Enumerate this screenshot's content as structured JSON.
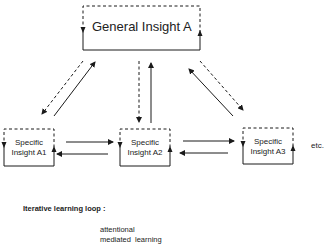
{
  "diagram": {
    "general_box": {
      "label": "General Insight A"
    },
    "specific_boxes": [
      {
        "line1": "Specific",
        "line2": "Insight A1"
      },
      {
        "line1": "Specific",
        "line2": "Insight A2"
      },
      {
        "line1": "Specific",
        "line2": "Insight A3"
      }
    ],
    "continuation": "etc.",
    "legend": {
      "title": "Iterative learning loop :",
      "line1": "attentional",
      "line2": "mediated  learning"
    }
  }
}
